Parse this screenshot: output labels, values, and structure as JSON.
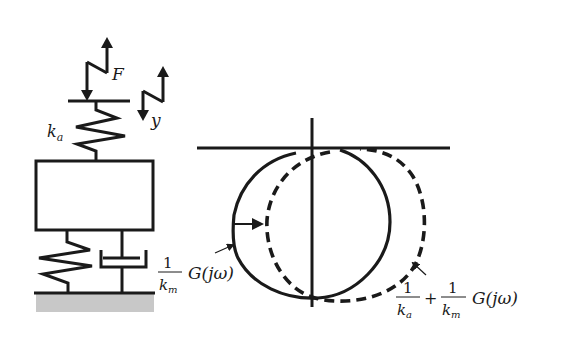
{
  "diagram": {
    "mechanical_model": {
      "force_label": "F",
      "displacement_label": "y",
      "upper_spring_label": "k",
      "upper_spring_sub": "a",
      "components": [
        "force-input",
        "upper-spring",
        "mass",
        "lower-spring",
        "damper",
        "ground"
      ]
    },
    "nyquist": {
      "curves": [
        {
          "name": "G(jω) scaled",
          "style": "solid",
          "label": {
            "numerator": "1",
            "denominator_main": "k",
            "denominator_sub": "m",
            "tail": "G(jω)"
          }
        },
        {
          "name": "shifted locus",
          "style": "dashed",
          "label": {
            "term1_numerator": "1",
            "term1_denominator_main": "k",
            "term1_denominator_sub": "a",
            "plus": "+",
            "term2_numerator": "1",
            "term2_denominator_main": "k",
            "term2_denominator_sub": "m",
            "tail": "G(jω)"
          }
        }
      ],
      "shift_arrow": "solid-to-dashed"
    },
    "colors": {
      "ink": "#1a1a1a",
      "ground": "#c8c8c8"
    }
  }
}
